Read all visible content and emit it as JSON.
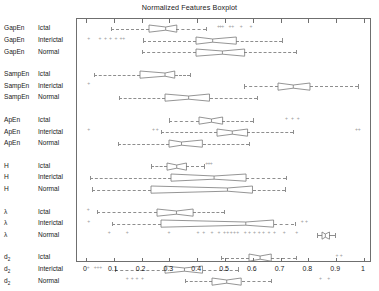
{
  "title": "Normalized Features Boxplot",
  "axis": {
    "xlabels": [
      "0",
      "0.1",
      "0.2",
      "0.3",
      "0.4",
      "0.5",
      "0.6",
      "0.7",
      "0.8",
      "0.9",
      "1"
    ],
    "xmin": 0,
    "xmax": 1,
    "grid": false,
    "orientation": "horizontal"
  },
  "rows": [
    {
      "feature": "GapEn",
      "feature_sub": "",
      "condition": "Ictal"
    },
    {
      "feature": "GapEn",
      "feature_sub": "",
      "condition": "Interictal"
    },
    {
      "feature": "GapEn",
      "feature_sub": "",
      "condition": "Normal"
    },
    {
      "feature": "SampEn",
      "feature_sub": "",
      "condition": "Ictal"
    },
    {
      "feature": "SampEn",
      "feature_sub": "",
      "condition": "Interictal"
    },
    {
      "feature": "SampEn",
      "feature_sub": "",
      "condition": "Normal"
    },
    {
      "feature": "ApEn",
      "feature_sub": "",
      "condition": "Ictal"
    },
    {
      "feature": "ApEn",
      "feature_sub": "",
      "condition": "Interictal"
    },
    {
      "feature": "ApEn",
      "feature_sub": "",
      "condition": "Normal"
    },
    {
      "feature": "H",
      "feature_sub": "",
      "condition": "Ictal"
    },
    {
      "feature": "H",
      "feature_sub": "",
      "condition": "Interictal"
    },
    {
      "feature": "H",
      "feature_sub": "",
      "condition": "Normal"
    },
    {
      "feature": "λ",
      "feature_sub": "",
      "condition": "Ictal"
    },
    {
      "feature": "λ",
      "feature_sub": "",
      "condition": "Interictal"
    },
    {
      "feature": "λ",
      "feature_sub": "",
      "condition": "Normal"
    },
    {
      "feature": "d",
      "feature_sub": "2",
      "condition": "Ictal"
    },
    {
      "feature": "d",
      "feature_sub": "2",
      "condition": "Interictal"
    },
    {
      "feature": "d",
      "feature_sub": "2",
      "condition": "Normal"
    }
  ],
  "chart_data": {
    "type": "boxplot",
    "orientation": "horizontal",
    "title": "Normalized Features Boxplot",
    "xlabel": "",
    "ylabel": "",
    "xlim": [
      0,
      1
    ],
    "xticks": [
      0,
      0.1,
      0.2,
      0.3,
      0.4,
      0.5,
      0.6,
      0.7,
      0.8,
      0.9,
      1
    ],
    "notched": true,
    "grid": false,
    "legend": null,
    "categories": [
      "GapEn Ictal",
      "GapEn Interictal",
      "GapEn Normal",
      "SampEn Ictal",
      "SampEn Interictal",
      "SampEn Normal",
      "ApEn Ictal",
      "ApEn Interictal",
      "ApEn Normal",
      "H Ictal",
      "H Interictal",
      "H Normal",
      "λ Ictal",
      "λ Interictal",
      "λ Normal",
      "d2 Ictal",
      "d2 Interictal",
      "d2 Normal"
    ],
    "boxes": [
      {
        "label": "GapEn Ictal",
        "whisker_low": 0.09,
        "q1": 0.225,
        "median": 0.285,
        "q3": 0.325,
        "whisker_high": 0.43,
        "outliers": [
          0.478,
          0.486,
          0.494,
          0.52,
          0.53,
          0.56,
          0.595
        ]
      },
      {
        "label": "GapEn Interictal",
        "whisker_low": 0.205,
        "q1": 0.395,
        "median": 0.455,
        "q3": 0.54,
        "whisker_high": 0.705,
        "outliers": [
          0.012,
          0.052,
          0.072,
          0.09,
          0.11,
          0.128,
          0.138
        ]
      },
      {
        "label": "GapEn Normal",
        "whisker_low": 0.2,
        "q1": 0.395,
        "median": 0.49,
        "q3": 0.57,
        "whisker_high": 0.755,
        "outliers": []
      },
      {
        "label": "SampEn Ictal",
        "whisker_low": 0.03,
        "q1": 0.195,
        "median": 0.285,
        "q3": 0.32,
        "whisker_high": 0.375,
        "outliers": []
      },
      {
        "label": "SampEn Interictal",
        "whisker_low": 0.57,
        "q1": 0.69,
        "median": 0.745,
        "q3": 0.805,
        "whisker_high": 0.98,
        "outliers": [
          0.012
        ]
      },
      {
        "label": "SampEn Normal",
        "whisker_low": 0.12,
        "q1": 0.285,
        "median": 0.37,
        "q3": 0.445,
        "whisker_high": 0.615,
        "outliers": []
      },
      {
        "label": "ApEn Ictal",
        "whisker_low": 0.3,
        "q1": 0.405,
        "median": 0.45,
        "q3": 0.49,
        "whisker_high": 0.6,
        "outliers": [
          0.723,
          0.745,
          0.765
        ]
      },
      {
        "label": "ApEn Interictal",
        "whisker_low": 0.27,
        "q1": 0.47,
        "median": 0.525,
        "q3": 0.58,
        "whisker_high": 0.745,
        "outliers": [
          0.012,
          0.245,
          0.258,
          0.975,
          0.985
        ]
      },
      {
        "label": "ApEn Normal",
        "whisker_low": 0.115,
        "q1": 0.3,
        "median": 0.345,
        "q3": 0.42,
        "whisker_high": 0.585,
        "outliers": []
      },
      {
        "label": "H Ictal",
        "whisker_low": 0.235,
        "q1": 0.29,
        "median": 0.325,
        "q3": 0.36,
        "whisker_high": 0.425,
        "outliers": [
          0.436,
          0.444,
          0.452
        ]
      },
      {
        "label": "H Interictal",
        "whisker_low": 0.015,
        "q1": 0.305,
        "median": 0.46,
        "q3": 0.575,
        "whisker_high": 0.72,
        "outliers": []
      },
      {
        "label": "H Normal",
        "whisker_low": 0.02,
        "q1": 0.235,
        "median": 0.51,
        "q3": 0.6,
        "whisker_high": 0.715,
        "outliers": []
      },
      {
        "label": "λ Ictal",
        "whisker_low": 0.04,
        "q1": 0.255,
        "median": 0.325,
        "q3": 0.385,
        "whisker_high": 0.495,
        "outliers": [
          0.01
        ]
      },
      {
        "label": "λ Interictal",
        "whisker_low": 0.095,
        "q1": 0.27,
        "median": 0.575,
        "q3": 0.675,
        "whisker_high": 0.75,
        "outliers": [
          0.012,
          0.78,
          0.795
        ]
      },
      {
        "label": "λ Normal",
        "whisker_low": 0.83,
        "q1": 0.848,
        "median": 0.86,
        "q3": 0.875,
        "whisker_high": 0.895,
        "outliers": [
          0.085,
          0.15,
          0.3,
          0.405,
          0.425,
          0.455,
          0.48,
          0.5,
          0.512,
          0.524,
          0.536,
          0.548,
          0.575,
          0.59,
          0.608,
          0.625,
          0.64,
          0.66,
          0.68,
          0.715,
          0.76
        ]
      },
      {
        "label": "d2 Ictal",
        "whisker_low": 0.485,
        "q1": 0.585,
        "median": 0.625,
        "q3": 0.665,
        "whisker_high": 0.755,
        "outliers": [
          0.905,
          0.92
        ]
      },
      {
        "label": "d2 Interictal",
        "whisker_low": 0.105,
        "q1": 0.285,
        "median": 0.355,
        "q3": 0.42,
        "whisker_high": 0.545,
        "outliers": [
          0.01,
          0.035,
          0.045,
          0.055
        ]
      },
      {
        "label": "d2 Normal",
        "whisker_low": 0.355,
        "q1": 0.455,
        "median": 0.508,
        "q3": 0.56,
        "whisker_high": 0.665,
        "outliers": [
          0.15,
          0.168,
          0.185,
          0.205,
          0.845,
          0.875
        ]
      }
    ]
  }
}
